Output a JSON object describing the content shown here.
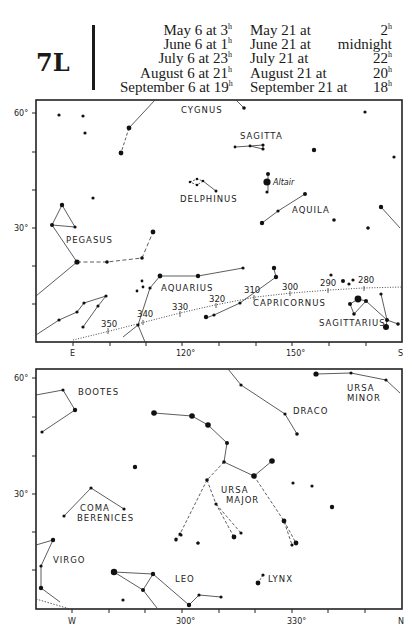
{
  "header": {
    "page_id": "7L",
    "times_left": [
      {
        "date": "May 6 at",
        "hour": "3",
        "unit": "h"
      },
      {
        "date": "June 6 at",
        "hour": "1",
        "unit": "h"
      },
      {
        "date": "July 6 at",
        "hour": "23",
        "unit": "h"
      },
      {
        "date": "August 6 at",
        "hour": "21",
        "unit": "h"
      },
      {
        "date": "September 6 at",
        "hour": "19",
        "unit": "h"
      }
    ],
    "times_right": [
      {
        "date": "May 21 at",
        "hour": "2",
        "unit": "h"
      },
      {
        "date": "June 21 at",
        "hour": "midnight",
        "unit": ""
      },
      {
        "date": "July 21 at",
        "hour": "22",
        "unit": "h"
      },
      {
        "date": "August 21 at",
        "hour": "20",
        "unit": "h"
      },
      {
        "date": "September 21 at",
        "hour": "18",
        "unit": "h"
      }
    ]
  },
  "top_chart": {
    "y_labels": [
      "60°",
      "30°"
    ],
    "x_labels": [
      "E",
      "120°",
      "150°",
      "S"
    ],
    "constellations": [
      "CYGNUS",
      "SAGITTA",
      "DELPHINUS",
      "AQUILA",
      "PEGASUS",
      "AQUARIUS",
      "CAPRICORNUS",
      "SAGITTARIUS"
    ],
    "star_names": [
      "Altair"
    ],
    "ecliptic_marks": [
      "350",
      "340",
      "330",
      "320",
      "310",
      "300",
      "290",
      "280"
    ]
  },
  "bottom_chart": {
    "y_labels": [
      "60°",
      "30°"
    ],
    "x_labels": [
      "W",
      "300°",
      "330°",
      "N"
    ],
    "constellations": [
      "BOOTES",
      "DRACO",
      "URSA",
      "MINOR",
      "URSA",
      "MAJOR",
      "COMA",
      "BERENICES",
      "VIRGO",
      "LEO",
      "LYNX"
    ]
  }
}
